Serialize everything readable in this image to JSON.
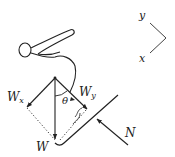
{
  "diagram": {
    "labels": {
      "w": "W",
      "wx_main": "W",
      "wx_sub": "x",
      "wy_main": "W",
      "wy_sub": "y",
      "theta": "θ",
      "normal": "N",
      "axis_y": "y",
      "axis_x": "x"
    },
    "colors": {
      "stroke": "#222222",
      "background": "#ffffff"
    }
  }
}
